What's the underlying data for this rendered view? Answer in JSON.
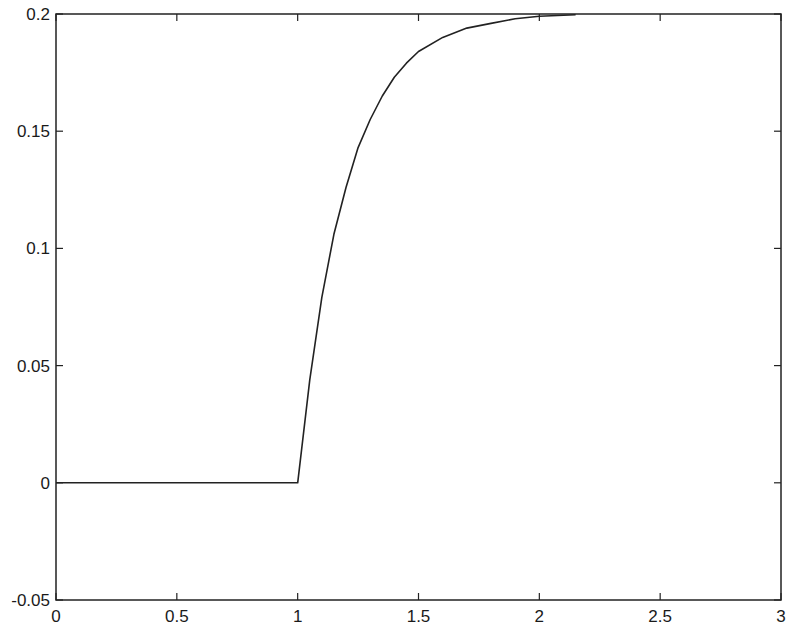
{
  "chart_data": {
    "type": "line",
    "title": "",
    "xlabel": "",
    "ylabel": "",
    "xlim": [
      0,
      3
    ],
    "ylim": [
      -0.05,
      0.2
    ],
    "grid": false,
    "legend": null,
    "x_ticks": [
      "0",
      "0.5",
      "1",
      "1.5",
      "2",
      "2.5",
      "3"
    ],
    "y_ticks": [
      "-0.05",
      "0",
      "0.05",
      "0.1",
      "0.15",
      "0.2"
    ],
    "series": [
      {
        "name": "step response",
        "color": "#222222",
        "x": [
          0,
          0.5,
          1.0,
          1.05,
          1.1,
          1.15,
          1.2,
          1.25,
          1.3,
          1.35,
          1.4,
          1.45,
          1.5,
          1.6,
          1.7,
          1.8,
          1.9,
          2.0,
          2.1,
          2.15
        ],
        "y": [
          0,
          0,
          0,
          0.044,
          0.079,
          0.106,
          0.126,
          0.143,
          0.155,
          0.165,
          0.173,
          0.179,
          0.184,
          0.19,
          0.194,
          0.196,
          0.198,
          0.199,
          0.1995,
          0.1997
        ]
      }
    ]
  },
  "plot": {
    "left_px": 56,
    "right_px": 781,
    "top_px": 14,
    "bottom_px": 600
  }
}
